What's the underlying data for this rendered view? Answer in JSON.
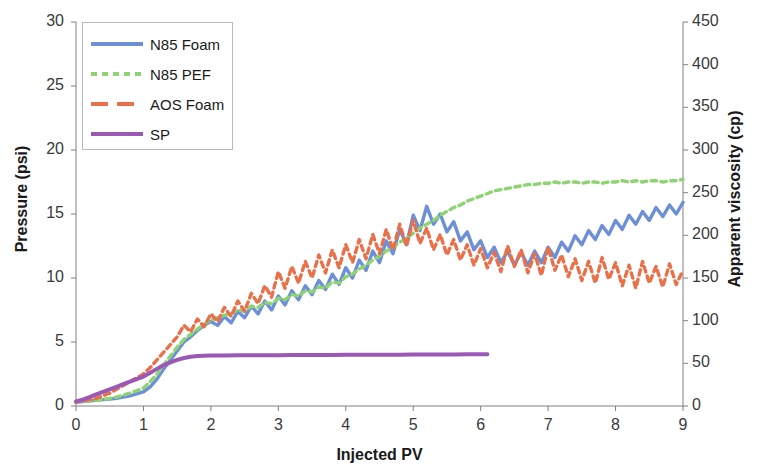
{
  "chart_data": {
    "type": "line",
    "title": "",
    "xlabel": "Injected PV",
    "ylabel": "Pressure (psi)",
    "y2label": "Apparent viscosity (cp)",
    "xlim": [
      0,
      9
    ],
    "ylim": [
      0,
      30
    ],
    "y2lim": [
      0,
      450
    ],
    "xticks": [
      "0",
      "1",
      "2",
      "3",
      "4",
      "5",
      "6",
      "7",
      "8",
      "9"
    ],
    "yticks": [
      "0",
      "5",
      "10",
      "15",
      "20",
      "25",
      "30"
    ],
    "y2ticks": [
      "0",
      "50",
      "100",
      "150",
      "200",
      "250",
      "300",
      "350",
      "400",
      "450"
    ],
    "grid": false,
    "legend_position": "upper-left",
    "colors": {
      "n85_foam": "#6d8fd8",
      "n85_pef": "#8ed472",
      "aos_foam": "#e8714a",
      "sp": "#9b59b6",
      "axis": "#808080",
      "text": "#1a1a1a"
    },
    "series": [
      {
        "name": "N85 Foam",
        "color": "#6d8fd8",
        "dash": "solid",
        "x": [
          0.0,
          0.1,
          0.2,
          0.3,
          0.4,
          0.5,
          0.6,
          0.7,
          0.8,
          0.9,
          1.0,
          1.1,
          1.2,
          1.3,
          1.4,
          1.5,
          1.6,
          1.7,
          1.8,
          1.9,
          2.0,
          2.1,
          2.2,
          2.3,
          2.4,
          2.5,
          2.6,
          2.7,
          2.8,
          2.9,
          3.0,
          3.1,
          3.2,
          3.3,
          3.4,
          3.5,
          3.6,
          3.7,
          3.8,
          3.9,
          4.0,
          4.1,
          4.2,
          4.3,
          4.4,
          4.5,
          4.6,
          4.7,
          4.8,
          4.9,
          5.0,
          5.1,
          5.2,
          5.3,
          5.4,
          5.5,
          5.6,
          5.7,
          5.8,
          5.9,
          6.0,
          6.1,
          6.2,
          6.3,
          6.4,
          6.5,
          6.6,
          6.7,
          6.8,
          6.9,
          7.0,
          7.1,
          7.2,
          7.3,
          7.4,
          7.5,
          7.6,
          7.7,
          7.8,
          7.9,
          8.0,
          8.1,
          8.2,
          8.3,
          8.4,
          8.5,
          8.6,
          8.7,
          8.8,
          8.9,
          9.0
        ],
        "y": [
          0.3,
          0.35,
          0.4,
          0.45,
          0.5,
          0.55,
          0.6,
          0.7,
          0.8,
          0.95,
          1.1,
          1.5,
          2.1,
          2.9,
          3.6,
          4.3,
          5.0,
          5.4,
          5.9,
          6.3,
          6.6,
          6.3,
          7.0,
          6.5,
          7.4,
          6.9,
          7.8,
          7.2,
          8.2,
          7.5,
          8.6,
          7.9,
          9.0,
          8.3,
          9.4,
          8.7,
          9.8,
          9.1,
          10.3,
          9.5,
          10.8,
          10.0,
          11.4,
          10.6,
          12.1,
          11.2,
          12.9,
          11.9,
          13.8,
          12.6,
          14.9,
          13.7,
          15.6,
          14.2,
          15.0,
          13.6,
          14.4,
          12.9,
          13.6,
          12.2,
          12.9,
          11.6,
          12.4,
          11.2,
          12.1,
          11.0,
          12.0,
          11.0,
          12.1,
          11.2,
          12.4,
          11.6,
          12.8,
          12.1,
          13.3,
          12.6,
          13.7,
          13.0,
          14.1,
          13.4,
          14.5,
          13.8,
          14.9,
          14.2,
          15.2,
          14.5,
          15.5,
          14.8,
          15.7,
          15.0,
          15.9
        ]
      },
      {
        "name": "N85 PEF",
        "color": "#8ed472",
        "dash": "dashed",
        "x": [
          0.0,
          0.1,
          0.2,
          0.3,
          0.4,
          0.5,
          0.6,
          0.7,
          0.8,
          0.9,
          1.0,
          1.1,
          1.2,
          1.3,
          1.4,
          1.5,
          1.6,
          1.7,
          1.8,
          1.9,
          2.0,
          2.1,
          2.2,
          2.3,
          2.4,
          2.5,
          2.6,
          2.7,
          2.8,
          2.9,
          3.0,
          3.1,
          3.2,
          3.3,
          3.4,
          3.5,
          3.6,
          3.7,
          3.8,
          3.9,
          4.0,
          4.1,
          4.2,
          4.3,
          4.4,
          4.5,
          4.6,
          4.7,
          4.8,
          4.9,
          5.0,
          5.1,
          5.2,
          5.3,
          5.4,
          5.5,
          5.6,
          5.7,
          5.8,
          5.9,
          6.0,
          6.1,
          6.2,
          6.3,
          6.4,
          6.5,
          6.6,
          6.7,
          6.8,
          6.9,
          7.0,
          7.1,
          7.2,
          7.3,
          7.4,
          7.5,
          7.6,
          7.7,
          7.8,
          7.9,
          8.0,
          8.1,
          8.2,
          8.3,
          8.4,
          8.5,
          8.6,
          8.7,
          8.8,
          8.9,
          9.0
        ],
        "y": [
          0.3,
          0.35,
          0.4,
          0.45,
          0.5,
          0.6,
          0.7,
          0.85,
          1.0,
          1.2,
          1.4,
          1.9,
          2.5,
          3.2,
          3.9,
          4.6,
          5.2,
          5.6,
          6.0,
          6.4,
          6.7,
          6.9,
          7.1,
          7.2,
          7.5,
          7.4,
          7.8,
          7.7,
          8.1,
          8.0,
          8.4,
          8.3,
          8.7,
          8.6,
          9.0,
          8.9,
          9.3,
          9.2,
          9.7,
          9.6,
          10.1,
          10.3,
          10.7,
          11.0,
          11.4,
          11.7,
          12.1,
          12.4,
          12.8,
          13.1,
          13.5,
          13.9,
          14.2,
          14.5,
          14.9,
          15.2,
          15.5,
          15.7,
          16.0,
          16.2,
          16.4,
          16.6,
          16.8,
          16.9,
          17.0,
          17.1,
          17.2,
          17.3,
          17.3,
          17.4,
          17.4,
          17.5,
          17.4,
          17.5,
          17.5,
          17.4,
          17.5,
          17.5,
          17.4,
          17.5,
          17.5,
          17.6,
          17.5,
          17.6,
          17.5,
          17.6,
          17.6,
          17.5,
          17.6,
          17.6,
          17.7
        ]
      },
      {
        "name": "AOS Foam",
        "color": "#e8714a",
        "dash": "dashed",
        "x": [
          0.0,
          0.1,
          0.2,
          0.3,
          0.4,
          0.5,
          0.6,
          0.7,
          0.8,
          0.9,
          1.0,
          1.1,
          1.2,
          1.3,
          1.4,
          1.5,
          1.6,
          1.7,
          1.8,
          1.9,
          2.0,
          2.1,
          2.2,
          2.3,
          2.4,
          2.5,
          2.6,
          2.7,
          2.8,
          2.9,
          3.0,
          3.1,
          3.2,
          3.3,
          3.4,
          3.5,
          3.6,
          3.7,
          3.8,
          3.9,
          4.0,
          4.1,
          4.2,
          4.3,
          4.4,
          4.5,
          4.6,
          4.7,
          4.8,
          4.9,
          5.0,
          5.1,
          5.2,
          5.3,
          5.4,
          5.5,
          5.6,
          5.7,
          5.8,
          5.9,
          6.0,
          6.1,
          6.2,
          6.3,
          6.4,
          6.5,
          6.6,
          6.7,
          6.8,
          6.9,
          7.0,
          7.1,
          7.2,
          7.3,
          7.4,
          7.5,
          7.6,
          7.7,
          7.8,
          7.9,
          8.0,
          8.1,
          8.2,
          8.3,
          8.4,
          8.5,
          8.6,
          8.7,
          8.8,
          8.9,
          9.0
        ],
        "y": [
          0.3,
          0.4,
          0.5,
          0.6,
          0.8,
          1.0,
          1.3,
          1.6,
          1.9,
          2.2,
          2.5,
          3.0,
          3.6,
          4.2,
          4.8,
          5.4,
          6.3,
          5.8,
          6.8,
          6.2,
          7.2,
          6.6,
          7.7,
          7.0,
          8.2,
          7.4,
          8.8,
          8.0,
          9.4,
          8.5,
          10.5,
          9.2,
          10.9,
          9.6,
          11.3,
          10.0,
          11.8,
          10.4,
          12.2,
          10.8,
          12.6,
          11.2,
          13.0,
          11.5,
          13.4,
          11.9,
          13.8,
          12.2,
          14.2,
          12.5,
          14.5,
          12.7,
          13.9,
          12.2,
          13.4,
          11.8,
          13.0,
          11.4,
          12.6,
          11.0,
          12.3,
          10.8,
          12.0,
          10.5,
          12.5,
          10.9,
          12.2,
          10.4,
          11.9,
          10.2,
          12.4,
          10.6,
          11.8,
          10.1,
          11.5,
          9.8,
          11.3,
          9.6,
          11.6,
          9.9,
          11.2,
          9.4,
          11.0,
          9.2,
          11.3,
          9.6,
          10.9,
          9.3,
          11.1,
          9.5,
          10.6
        ]
      },
      {
        "name": "SP",
        "color": "#9b59b6",
        "dash": "solid",
        "x": [
          0.0,
          0.1,
          0.2,
          0.3,
          0.4,
          0.5,
          0.6,
          0.7,
          0.8,
          0.9,
          1.0,
          1.1,
          1.2,
          1.3,
          1.4,
          1.5,
          1.6,
          1.7,
          1.8,
          1.9,
          2.0,
          2.2,
          2.4,
          2.6,
          2.8,
          3.0,
          3.2,
          3.4,
          3.6,
          3.8,
          4.0,
          4.2,
          4.4,
          4.6,
          4.8,
          5.0,
          5.2,
          5.4,
          5.6,
          5.8,
          6.0,
          6.1
        ],
        "y": [
          0.35,
          0.5,
          0.7,
          0.9,
          1.1,
          1.3,
          1.5,
          1.7,
          1.9,
          2.1,
          2.3,
          2.6,
          2.9,
          3.2,
          3.4,
          3.6,
          3.75,
          3.85,
          3.9,
          3.92,
          3.94,
          3.95,
          3.96,
          3.96,
          3.97,
          3.97,
          3.98,
          3.98,
          3.99,
          3.99,
          4.0,
          4.0,
          4.0,
          4.01,
          4.01,
          4.02,
          4.02,
          4.03,
          4.03,
          4.04,
          4.05,
          4.05
        ]
      }
    ]
  },
  "legend": {
    "items": [
      {
        "label": "N85 Foam",
        "color": "#6d8fd8",
        "dash": "solid"
      },
      {
        "label": "N85 PEF",
        "color": "#8ed472",
        "dash": "dashed"
      },
      {
        "label": "AOS Foam",
        "color": "#e8714a",
        "dash": "dashed-wide"
      },
      {
        "label": "SP",
        "color": "#9b59b6",
        "dash": "solid"
      }
    ]
  }
}
